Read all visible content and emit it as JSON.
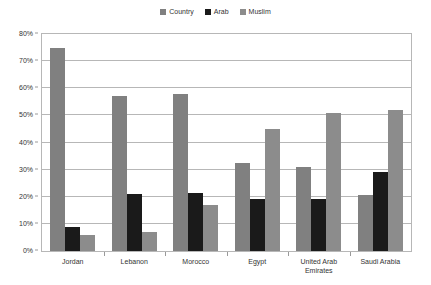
{
  "chart_data": {
    "type": "bar",
    "title": "",
    "subtitle": "",
    "xlabel": "",
    "ylabel": "",
    "ylim": [
      0,
      80
    ],
    "ytick_labels": [
      "0%",
      "10%",
      "20%",
      "30%",
      "40%",
      "50%",
      "60%",
      "70%",
      "80%"
    ],
    "ytick_values": [
      0,
      10,
      20,
      30,
      40,
      50,
      60,
      70,
      80
    ],
    "grid": true,
    "legend_position": "top-center",
    "categories": [
      "Jordan",
      "Lebanon",
      "Morocco",
      "Egypt",
      "United Arab\nEmirates",
      "Saudi Arabia"
    ],
    "series": [
      {
        "name": "Country",
        "color": "#808080",
        "values": [
          75,
          57,
          58,
          32.5,
          31,
          20.5
        ]
      },
      {
        "name": "Arab",
        "color": "#1a1a1a",
        "values": [
          9,
          21,
          21.5,
          19,
          19,
          29
        ]
      },
      {
        "name": "Muslim",
        "color": "#8c8c8c",
        "values": [
          6,
          7,
          17,
          45,
          51,
          52
        ]
      }
    ]
  },
  "legend": {
    "entries": [
      {
        "label": "Country",
        "color": "#808080"
      },
      {
        "label": "Arab",
        "color": "#1a1a1a"
      },
      {
        "label": "Muslim",
        "color": "#8c8c8c"
      }
    ]
  },
  "axes": {
    "border_color": "#b7b7b7",
    "tick_color": "#9a9a9a",
    "text_color": "#333333"
  }
}
